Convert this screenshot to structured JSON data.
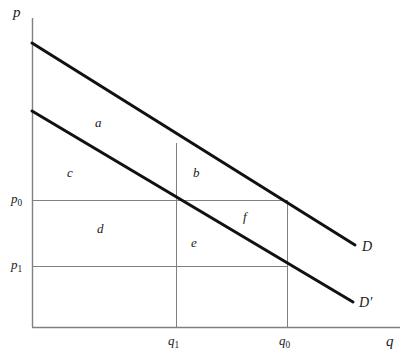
{
  "figure": {
    "type": "economics-supply-demand-diagram",
    "background_color": "#ffffff",
    "axes": {
      "y_label": "p",
      "x_label": "q",
      "axis_color": "#808080",
      "origin_px": {
        "x": 32,
        "y": 327
      },
      "x_axis_end_px": 400,
      "y_axis_top_px": 18
    },
    "price_ticks": [
      {
        "id": "p0",
        "label_main": "p",
        "label_sub": "0",
        "y_px": 200
      },
      {
        "id": "p1",
        "label_main": "p",
        "label_sub": "1",
        "y_px": 266
      }
    ],
    "quantity_ticks": [
      {
        "id": "q1",
        "label_main": "q",
        "label_sub": "1",
        "x_px": 176
      },
      {
        "id": "q0",
        "label_main": "q",
        "label_sub": "0",
        "x_px": 287
      }
    ],
    "curves": [
      {
        "id": "D",
        "label": "D",
        "label_prime": "",
        "color": "#111111",
        "width": 3,
        "start_px": {
          "x": 32,
          "y": 43
        },
        "end_px": {
          "x": 355,
          "y": 245
        },
        "label_px": {
          "x": 362,
          "y": 240
        }
      },
      {
        "id": "Dprime",
        "label": "D",
        "label_prime": "′",
        "color": "#111111",
        "width": 3,
        "start_px": {
          "x": 32,
          "y": 111
        },
        "end_px": {
          "x": 353,
          "y": 302
        },
        "label_px": {
          "x": 360,
          "y": 297
        }
      }
    ],
    "regions": [
      {
        "id": "a",
        "label": "a",
        "x_px": 98,
        "y_px": 122
      },
      {
        "id": "c",
        "label": "c",
        "x_px": 70,
        "y_px": 172
      },
      {
        "id": "b",
        "label": "b",
        "x_px": 196,
        "y_px": 172
      },
      {
        "id": "d",
        "label": "d",
        "x_px": 100,
        "y_px": 228
      },
      {
        "id": "e",
        "label": "e",
        "x_px": 194,
        "y_px": 242
      },
      {
        "id": "f",
        "label": "f",
        "x_px": 245,
        "y_px": 216
      }
    ],
    "construction_lines": {
      "color": "#808080",
      "width": 1,
      "horizontal": [
        {
          "id": "p0-line",
          "y_px": 200,
          "x_from": 32,
          "x_to": 287
        },
        {
          "id": "p1-line",
          "y_px": 266,
          "x_from": 32,
          "x_to": 287
        }
      ],
      "vertical": [
        {
          "id": "q1-line",
          "x_px": 176,
          "y_from": 143,
          "y_to": 327
        },
        {
          "id": "q0-line",
          "x_px": 287,
          "y_from": 200,
          "y_to": 327
        }
      ]
    }
  }
}
